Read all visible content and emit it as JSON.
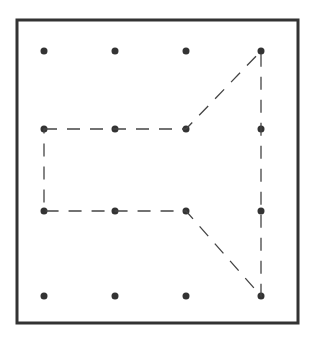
{
  "diagram": {
    "type": "geoboard",
    "frame": {
      "x": 17,
      "y": 20,
      "width": 281,
      "height": 303,
      "stroke": "#333333",
      "stroke_width": 3
    },
    "grid": {
      "cols": [
        44,
        115,
        186,
        261
      ],
      "rows": [
        51,
        129,
        211,
        296
      ],
      "dot_radius": 3.5,
      "dot_color": "#333333"
    },
    "shape": {
      "description": "Dashed polygon on 4x4 dot grid",
      "stroke": "#444444",
      "dash": "13,10",
      "vertices": [
        [
          44,
          129
        ],
        [
          186,
          129
        ],
        [
          261,
          51
        ],
        [
          261,
          296
        ],
        [
          186,
          211
        ],
        [
          44,
          211
        ]
      ]
    }
  }
}
